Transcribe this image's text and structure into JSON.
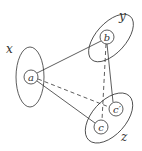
{
  "diagram": {
    "groups": [
      {
        "id": "x",
        "label": "x",
        "cx": 30,
        "cy": 77,
        "rx": 14,
        "ry": 30,
        "rotate": 0,
        "label_x": 6,
        "label_y": 53
      },
      {
        "id": "y",
        "label": "y",
        "cx": 111,
        "cy": 38,
        "rx": 29,
        "ry": 15,
        "rotate": -48,
        "label_x": 119,
        "label_y": 20
      },
      {
        "id": "z",
        "label": "z",
        "cx": 109,
        "cy": 118,
        "rx": 30,
        "ry": 17,
        "rotate": -48,
        "label_x": 121,
        "label_y": 141
      }
    ],
    "nodes": [
      {
        "id": "a",
        "label": "a",
        "group": "x",
        "cx": 31,
        "cy": 77,
        "r": 7
      },
      {
        "id": "b",
        "label": "b",
        "group": "y",
        "cx": 107,
        "cy": 37,
        "r": 7
      },
      {
        "id": "c_prime",
        "label": "c′",
        "group": "z",
        "cx": 116,
        "cy": 109,
        "r": 7
      },
      {
        "id": "c",
        "label": "c",
        "group": "z",
        "cx": 101,
        "cy": 127,
        "r": 7
      }
    ],
    "edges": [
      {
        "from": "a",
        "to": "b",
        "style": "solid"
      },
      {
        "from": "a",
        "to": "c",
        "style": "solid"
      },
      {
        "from": "b",
        "to": "c_prime",
        "style": "solid"
      },
      {
        "from": "a",
        "to": "c_prime",
        "style": "dashed"
      },
      {
        "from": "b",
        "to": "c",
        "style": "dashed"
      }
    ]
  }
}
